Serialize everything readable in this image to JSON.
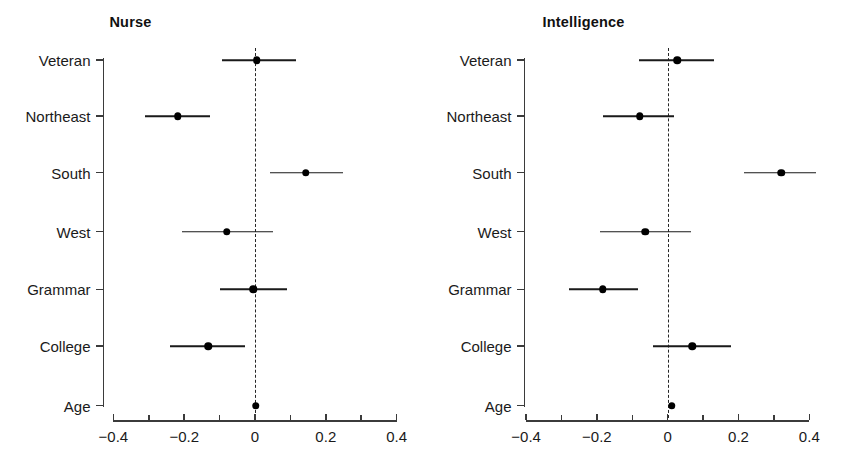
{
  "chart_data": [
    {
      "type": "scatter",
      "title": "Nurse",
      "xlabel": "",
      "ylabel": "",
      "xlim": [
        -0.45,
        0.45
      ],
      "xticks": [
        -0.4,
        -0.2,
        0,
        0.2,
        0.4
      ],
      "xticklabels": [
        "−0.4",
        "−0.2",
        "0",
        "0.2",
        "0.4"
      ],
      "minor_xticks": [
        -0.3,
        -0.1,
        0.1,
        0.3
      ],
      "categories": [
        "Veteran",
        "Northeast",
        "South",
        "West",
        "Grammar",
        "College",
        "Age"
      ],
      "grid": false,
      "legend": "none",
      "reference_line": 0,
      "reference_line_style": "dashed",
      "points": [
        {
          "label": "Veteran",
          "estimate": 0.005,
          "ci_low": -0.094,
          "ci_high": 0.115
        },
        {
          "label": "Northeast",
          "estimate": -0.218,
          "ci_low": -0.31,
          "ci_high": -0.127
        },
        {
          "label": "South",
          "estimate": 0.144,
          "ci_low": 0.042,
          "ci_high": 0.249
        },
        {
          "label": "West",
          "estimate": -0.08,
          "ci_low": -0.207,
          "ci_high": 0.052
        },
        {
          "label": "Grammar",
          "estimate": -0.005,
          "ci_low": -0.099,
          "ci_high": 0.089
        },
        {
          "label": "College",
          "estimate": -0.132,
          "ci_low": -0.239,
          "ci_high": -0.028
        },
        {
          "label": "Age",
          "estimate": 0.002,
          "ci_low": -0.002,
          "ci_high": 0.005
        }
      ]
    },
    {
      "type": "scatter",
      "title": "Intelligence",
      "xlabel": "",
      "ylabel": "",
      "xlim": [
        -0.45,
        0.45
      ],
      "xticks": [
        -0.4,
        -0.2,
        0,
        0.2,
        0.4
      ],
      "xticklabels": [
        "−0.4",
        "−0.2",
        "0",
        "0.2",
        "0.4"
      ],
      "minor_xticks": [
        -0.3,
        -0.1,
        0.1,
        0.3
      ],
      "categories": [
        "Veteran",
        "Northeast",
        "South",
        "West",
        "Grammar",
        "College",
        "Age"
      ],
      "grid": false,
      "legend": "none",
      "reference_line": 0,
      "reference_line_style": "dashed",
      "points": [
        {
          "label": "Veteran",
          "estimate": 0.027,
          "ci_low": -0.08,
          "ci_high": 0.13
        },
        {
          "label": "Northeast",
          "estimate": -0.079,
          "ci_low": -0.183,
          "ci_high": 0.018
        },
        {
          "label": "South",
          "estimate": 0.321,
          "ci_low": 0.216,
          "ci_high": 0.418
        },
        {
          "label": "West",
          "estimate": -0.064,
          "ci_low": -0.192,
          "ci_high": 0.065
        },
        {
          "label": "Grammar",
          "estimate": -0.183,
          "ci_low": -0.279,
          "ci_high": -0.083
        },
        {
          "label": "College",
          "estimate": 0.07,
          "ci_low": -0.041,
          "ci_high": 0.179
        },
        {
          "label": "Age",
          "estimate": 0.011,
          "ci_low": 0.004,
          "ci_high": 0.018
        }
      ]
    }
  ],
  "colors": {
    "point": "#000000",
    "line": "#1a1a1a",
    "axis": "#3b3b3b",
    "background": "#ffffff"
  }
}
